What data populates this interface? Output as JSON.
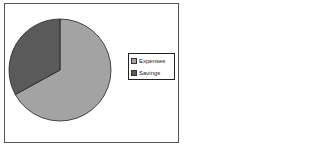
{
  "chart_data": {
    "type": "pie",
    "title": "",
    "categories": [
      "Expenses",
      "Savings"
    ],
    "values": [
      67,
      33
    ],
    "colors": [
      "#a3a3a3",
      "#5a5a5a"
    ],
    "legend_position": "right"
  },
  "legend": {
    "items": [
      {
        "label": "Expenses",
        "color": "#a3a3a3"
      },
      {
        "label": "Savings",
        "color": "#5a5a5a"
      }
    ]
  }
}
